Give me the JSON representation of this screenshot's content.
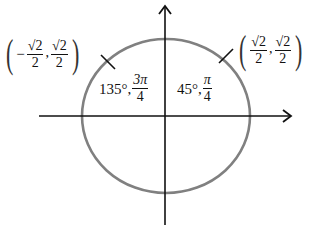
{
  "diagram": {
    "type": "unit-circle",
    "axes": {
      "x_arrow": true,
      "y_arrow": true
    },
    "colors": {
      "circle": "#808080",
      "axes": "#111111",
      "background": "#ffffff"
    },
    "points": [
      {
        "quadrant": "II",
        "coord": {
          "x_sign": "−",
          "x_num": "√2",
          "x_den": "2",
          "y_num": "√2",
          "y_den": "2"
        },
        "angle": {
          "degrees": "135°,",
          "rad_num": "3π",
          "rad_den": "4"
        }
      },
      {
        "quadrant": "I",
        "coord": {
          "x_num": "√2",
          "x_den": "2",
          "y_num": "√2",
          "y_den": "2"
        },
        "angle": {
          "degrees": "45°,",
          "rad_num": "π",
          "rad_den": "4"
        }
      }
    ],
    "punct": {
      "open": "(",
      "close": ")",
      "comma": ","
    }
  }
}
